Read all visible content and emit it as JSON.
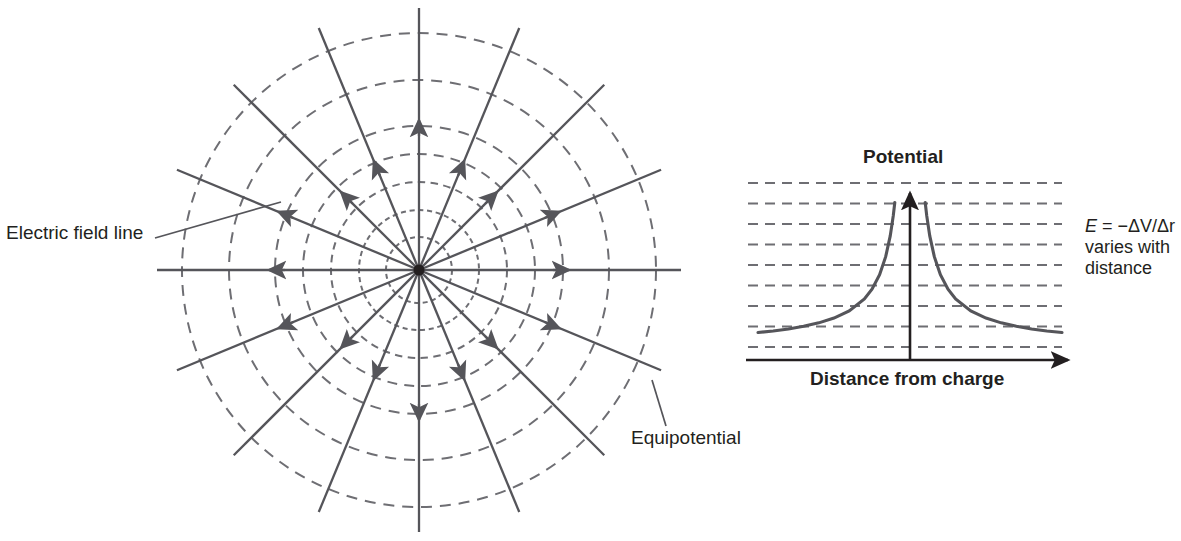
{
  "figure": {
    "title_hidden": "Electric field and potential of a point charge",
    "stroke_color": "#55555a",
    "dash_color": "#6e6e73",
    "text_color": "#231f20",
    "axis_color": "#231f20"
  },
  "labels": {
    "electric_field_line": "Electric field line",
    "equipotential": "Equipotential",
    "potential": "Potential",
    "distance_from_charge": "Distance from charge",
    "formula_symbol": "E",
    "formula_body": " = −ΔV/Δr",
    "formula_note_line1": "varies with",
    "formula_note_line2": "distance"
  },
  "field_diagram": {
    "center_x": 419,
    "center_y": 270,
    "radial_line_count": 16,
    "angle_step_degrees": 22.5,
    "equipotential_radii": [
      33,
      60,
      88,
      116,
      144,
      190,
      237
    ],
    "field_line_inner_radius": 4,
    "field_line_outer_radius": 262,
    "arrow_radii": [
      150,
      152,
      110,
      118,
      150,
      118,
      110,
      152,
      150,
      152,
      110,
      118,
      150,
      118,
      110,
      152
    ],
    "charge_polarity": "positive",
    "arrow_direction": "outward"
  },
  "chart_data": {
    "type": "line",
    "title": "Potential",
    "xlabel": "Distance from charge",
    "ylabel": "",
    "annotation": "E = −ΔV/Δr varies with distance",
    "grid": true,
    "gridline_count": 9,
    "gridline_style": "dashed-horizontal-equipotential",
    "x": [
      -1.0,
      -0.9,
      -0.8,
      -0.7,
      -0.6,
      -0.5,
      -0.4,
      -0.3,
      -0.25,
      -0.2,
      -0.16,
      -0.13,
      -0.11,
      -0.1,
      0.1,
      0.11,
      0.13,
      0.16,
      0.2,
      0.25,
      0.3,
      0.4,
      0.5,
      0.6,
      0.7,
      0.8,
      0.9,
      1.0
    ],
    "y": [
      0.1,
      0.111,
      0.125,
      0.143,
      0.167,
      0.2,
      0.25,
      0.333,
      0.4,
      0.5,
      0.625,
      0.769,
      0.909,
      1.0,
      1.0,
      0.909,
      0.769,
      0.625,
      0.5,
      0.4,
      0.333,
      0.25,
      0.2,
      0.167,
      0.143,
      0.125,
      0.111,
      0.1
    ],
    "relation": "V proportional to 1/r",
    "xlim": [
      -1.0,
      1.0
    ],
    "ylim": [
      0,
      1.05
    ],
    "axis_arrow_x": "right",
    "axis_arrow_y": "up",
    "legend": []
  }
}
